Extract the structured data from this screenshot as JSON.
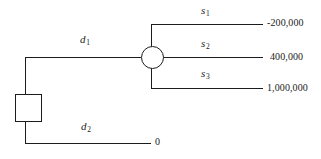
{
  "diagram": {
    "nodes": [
      {
        "id": "1",
        "label": "1",
        "shape": "square",
        "type": "decision-node",
        "x": 15,
        "y": 94,
        "w": 27,
        "h": 28
      },
      {
        "id": "2",
        "label": "2",
        "shape": "circle",
        "type": "chance-node",
        "cx": 152,
        "cy": 57,
        "r": 11.5
      }
    ],
    "decision_branches": [
      {
        "name": "d1",
        "label_base": "d",
        "label_sub": "1",
        "label_x": 80,
        "label_y": 34
      },
      {
        "name": "d2",
        "label_base": "d",
        "label_sub": "2",
        "label_x": 81,
        "label_y": 121
      }
    ],
    "state_branches": [
      {
        "name": "s1",
        "label_base": "s",
        "label_sub": "1",
        "label_x": 201,
        "label_y": 5,
        "payoff": "-200,000",
        "payoff_x": 267,
        "payoff_y": 18,
        "line_y": 24
      },
      {
        "name": "s2",
        "label_base": "s",
        "label_sub": "2",
        "label_x": 201,
        "label_y": 38,
        "payoff": "400,000",
        "payoff_x": 270,
        "payoff_y": 52,
        "line_y": 57
      },
      {
        "name": "s3",
        "label_base": "s",
        "label_sub": "3",
        "label_x": 201,
        "label_y": 68,
        "payoff": "1,000,000",
        "payoff_x": 267,
        "payoff_y": 83,
        "line_y": 88
      }
    ],
    "terminal_d2": {
      "payoff": "0",
      "payoff_x": 155,
      "payoff_y": 138
    },
    "colors": {
      "stroke": "#1c1c1c",
      "background": "#ffffff"
    }
  }
}
